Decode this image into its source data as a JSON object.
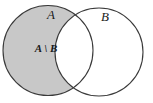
{
  "figure": {
    "kind": "venn-diagram",
    "title": "",
    "background_color": "#ffffff",
    "width": 153,
    "height": 103
  },
  "diagram": {
    "shading_color": "#c8c8c8",
    "unshaded_color": "#ffffff",
    "outline_color": "#3a3a3a",
    "outline_width": 1.1,
    "sets": [
      {
        "name": "set-a",
        "label": "A",
        "label_x": 51,
        "label_y": 16,
        "cx": 48,
        "cy": 50.5,
        "r": 45,
        "shaded": true
      },
      {
        "name": "set-b",
        "label": "B",
        "label_x": 105,
        "label_y": 18,
        "cx": 99,
        "cy": 52,
        "r": 44,
        "shaded": false
      }
    ],
    "regions": [
      {
        "name": "a-minus-b",
        "label": "A \\ B",
        "label_x": 46,
        "label_y": 49,
        "shaded": true
      },
      {
        "name": "a-intersect-b",
        "label": "",
        "shaded": false
      },
      {
        "name": "b-minus-a",
        "label": "",
        "shaded": false
      }
    ]
  }
}
